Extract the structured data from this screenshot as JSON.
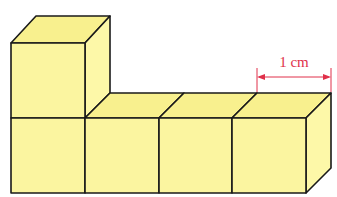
{
  "diagram": {
    "cube_count": 5,
    "layout": {
      "bottom_row_cubes": 4,
      "stacked_on_first": 1
    },
    "dimension_label": "1 cm",
    "colors": {
      "cube_face": "#fbf5a0",
      "cube_edge": "#1a1a1a",
      "dimension": "#e0304a"
    }
  }
}
